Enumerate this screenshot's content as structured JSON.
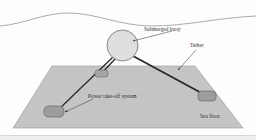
{
  "figure": {
    "background_color": "#ffffff",
    "width": 256,
    "height": 140
  },
  "colors": {
    "sea_surface_line": "#8a8a8a",
    "seafloor_fill": "#c6c6c6",
    "seafloor_stroke": "#9a9a9a",
    "buoy_fill": "#e0e0e0",
    "buoy_stroke": "#6f6f6f",
    "tether_stroke": "#2a2a2a",
    "pto_fill": "#9e9e9e",
    "pto_stroke": "#5a5a5a",
    "label_text": "#2b2b2b",
    "leader_line": "#4a4a4a"
  },
  "labels": {
    "submerged_buoy": "Submerged buoy",
    "tether": "Tether",
    "power_take_off": "Power take-off system",
    "sea_floor": "Sea floor"
  },
  "geometry": {
    "sea_surface_path": "M 0,26 C 24,24 44,13 68,13 C 96,13 120,26 152,26 C 186,26 216,18 256,16",
    "seafloor_points": "52,66 195,66 243,128 13,128",
    "buoy": {
      "cx": 122.5,
      "cy": 45.5,
      "r": 15.5
    },
    "tethers": [
      {
        "name": "tether-left-long",
        "x1": 113,
        "y1": 57,
        "x2": 56,
        "y2": 112
      },
      {
        "name": "tether-left-short",
        "x1": 116,
        "y1": 58,
        "x2": 99,
        "y2": 76
      },
      {
        "name": "tether-right",
        "x1": 133,
        "y1": 56,
        "x2": 207,
        "y2": 96
      }
    ],
    "pto_units": [
      {
        "name": "pto-left",
        "x": 44,
        "y": 106,
        "w": 20,
        "h": 11,
        "rx": 4
      },
      {
        "name": "pto-middle",
        "x": 95,
        "y": 70,
        "w": 13,
        "h": 7,
        "rx": 2.5
      },
      {
        "name": "pto-right",
        "x": 198,
        "y": 91,
        "w": 18,
        "h": 10,
        "rx": 3.5
      }
    ],
    "leaders": [
      {
        "name": "leader-submerged-buoy",
        "path": "M 172,31 L 132,41",
        "arrow": true
      },
      {
        "name": "leader-tether",
        "path": "M 196,50 L 178,71",
        "arrow": true
      },
      {
        "name": "leader-power-take-off",
        "path": "M 93,99 L 64,112",
        "arrow": true
      }
    ],
    "label_positions": {
      "submerged_buoy": {
        "x": 144,
        "y": 31
      },
      "tether": {
        "x": 190,
        "y": 47
      },
      "power_take_off": {
        "x": 88,
        "y": 98
      },
      "sea_floor": {
        "x": 200,
        "y": 118
      }
    }
  }
}
